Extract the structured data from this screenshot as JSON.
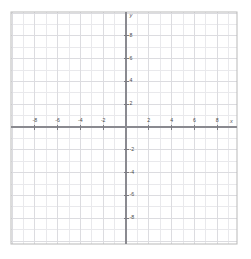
{
  "chart_data": {
    "type": "scatter",
    "title": "",
    "subtitle": "",
    "xlabel": "x",
    "ylabel": "y",
    "grid": true,
    "legend": null,
    "xlim": [
      -10,
      9.7
    ],
    "ylim": [
      -10.2,
      10
    ],
    "x_tick_step": 2,
    "y_tick_step": 2,
    "minor_grid_step": 1,
    "x_ticks": [
      -8,
      -6,
      -4,
      -2,
      2,
      4,
      6,
      8
    ],
    "y_ticks": [
      8,
      6,
      4,
      2,
      -2,
      -4,
      -6,
      -8
    ],
    "x_tick_labels": [
      "-8",
      "-6",
      "-4",
      "-2",
      "2",
      "4",
      "6",
      "8"
    ],
    "y_tick_labels": [
      "8",
      "6",
      "4",
      "2",
      "-2",
      "-4",
      "-6",
      "-8"
    ],
    "series": [
      {
        "name": "data",
        "x": [],
        "y": []
      }
    ],
    "annotations": []
  },
  "colors": {
    "background": "#ffffff",
    "border": "#b9b9b9",
    "minor_grid": "#e9e9ec",
    "major_grid": "#dcdce0",
    "axis": "#8a8a90",
    "tick_mark": "#7d7d83",
    "label_text": "#4a4a4a"
  },
  "axis_labels": {
    "x_letter": "x",
    "y_letter": "y"
  },
  "geometry": {
    "frame_left": 11,
    "frame_top": 12,
    "frame_right": 237,
    "frame_bottom": 244,
    "origin_x": 126,
    "origin_y": 127,
    "unit_px": 11.4
  }
}
